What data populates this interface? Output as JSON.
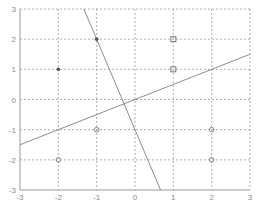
{
  "chart_data": {
    "type": "scatter",
    "title": "",
    "xlabel": "",
    "ylabel": "",
    "xlim": [
      -3,
      3
    ],
    "ylim": [
      -3,
      3
    ],
    "grid": true,
    "legend": "none",
    "xticks": [
      -3,
      -2,
      -1,
      0,
      1,
      2,
      3
    ],
    "yticks": [
      -3,
      -2,
      -1,
      0,
      1,
      2,
      3
    ],
    "xtick_labels": [
      "-3",
      "-2",
      "-1",
      "0",
      "1",
      "2",
      "3"
    ],
    "ytick_labels": [
      "-3",
      "-2",
      "-1",
      "0",
      "1",
      "2",
      "3"
    ],
    "series": [
      {
        "name": "class-dot",
        "marker": "dot",
        "color": "#555555",
        "points": [
          [
            -2,
            1
          ],
          [
            -1,
            2
          ]
        ]
      },
      {
        "name": "class-square",
        "marker": "square",
        "color": "#777777",
        "points": [
          [
            1,
            2
          ],
          [
            1,
            1
          ]
        ]
      },
      {
        "name": "class-circle",
        "marker": "circle",
        "color": "#888888",
        "points": [
          [
            -1,
            -1
          ],
          [
            -2,
            -2
          ],
          [
            2,
            -1
          ],
          [
            2,
            -2
          ]
        ]
      }
    ],
    "lines": [
      {
        "name": "steep-boundary",
        "equation": "y = -3x - 1",
        "points": [
          [
            -1.3333,
            3
          ],
          [
            0.6667,
            -3
          ]
        ],
        "color": "#8c8c8c"
      },
      {
        "name": "shallow-boundary",
        "equation": "y = 0.5x",
        "points": [
          [
            -3,
            -1.5
          ],
          [
            3,
            1.5
          ]
        ],
        "color": "#8c8c8c"
      }
    ]
  }
}
